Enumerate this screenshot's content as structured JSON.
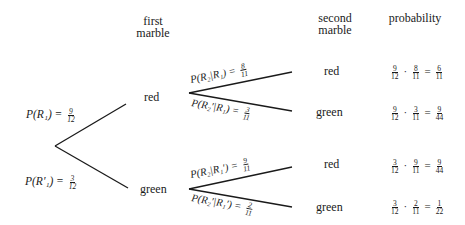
{
  "headers": {
    "first": "first",
    "first2": "marble",
    "second": "second",
    "second2": "marble",
    "probability": "probability"
  },
  "first_level": {
    "red": {
      "label": "red",
      "prob_text": "P(R₁) = ",
      "num": "9",
      "den": "12"
    },
    "green": {
      "label": "green",
      "prob_text": "P(R′₁) = ",
      "num": "3",
      "den": "12"
    }
  },
  "second_level": [
    {
      "label": "red",
      "prob_text": "P(R₂|R₁) = ",
      "num": "8",
      "den": "11",
      "result": {
        "a_num": "9",
        "a_den": "12",
        "b_num": "8",
        "b_den": "11",
        "r_num": "6",
        "r_den": "11"
      }
    },
    {
      "label": "green",
      "prob_text": "P(R₂′|R₁) = ",
      "num": "3",
      "den": "11",
      "result": {
        "a_num": "9",
        "a_den": "12",
        "b_num": "3",
        "b_den": "11",
        "r_num": "9",
        "r_den": "44"
      }
    },
    {
      "label": "red",
      "prob_text": "P(R₂|R₁′) = ",
      "num": "9",
      "den": "11",
      "result": {
        "a_num": "3",
        "a_den": "12",
        "b_num": "9",
        "b_den": "11",
        "r_num": "9",
        "r_den": "44"
      }
    },
    {
      "label": "green",
      "prob_text": "P(R₂′|R₁′) = ",
      "num": "2",
      "den": "11",
      "result": {
        "a_num": "3",
        "a_den": "12",
        "b_num": "2",
        "b_den": "11",
        "r_num": "1",
        "r_den": "22"
      }
    }
  ],
  "operators": {
    "dot": "·",
    "eq": "="
  },
  "colors": {
    "line": "#1a1a1a",
    "background": "#ffffff"
  }
}
